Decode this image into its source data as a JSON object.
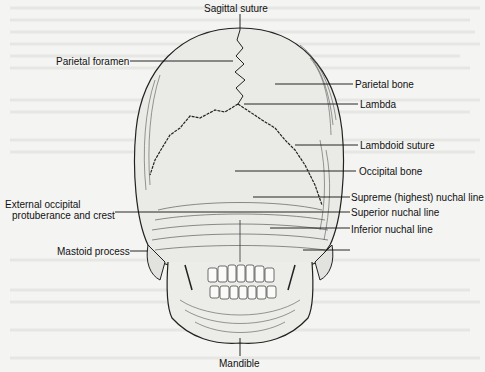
{
  "figure": {
    "labels": {
      "sagittal_suture": "Sagittal suture",
      "parietal_foramen": "Parietal foramen",
      "parietal_bone": "Parietal bone",
      "lambda": "Lambda",
      "lambdoid_suture": "Lambdoid suture",
      "occipital_bone": "Occipital bone",
      "external_occipital_line1": "External occipital",
      "external_occipital_line2": "protuberance and crest",
      "supreme_nuchal_line": "Supreme (highest) nuchal line",
      "superior_nuchal_line": "Superior nuchal line",
      "inferior_nuchal_line": "Inferior nuchal line",
      "mastoid_process": "Mastoid process",
      "mandible": "Mandible"
    }
  }
}
